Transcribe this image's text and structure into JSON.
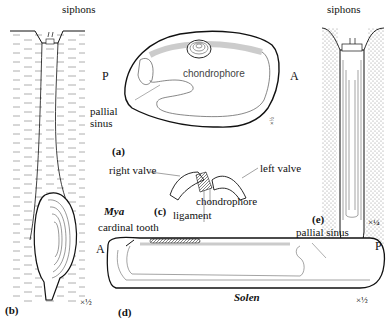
{
  "figure": {
    "panels": {
      "a": {
        "id": "(a)",
        "labels": {
          "posterior": "P",
          "anterior": "A",
          "chondrophore": "chondrophore",
          "pallial_sinus": "pallial\nsinus",
          "pallial": "pallial",
          "sinus": "sinus"
        },
        "scale": "×½"
      },
      "b": {
        "id": "(b)",
        "labels": {
          "siphons": "siphons"
        },
        "scale": "×½"
      },
      "c": {
        "id": "(c)",
        "labels": {
          "right_valve": "right valve",
          "left_valve": "left valve",
          "chondrophore": "chondrophore",
          "ligament": "ligament"
        }
      },
      "d": {
        "id": "(d)",
        "genus_mya": "Mya",
        "genus_solen": "Solen",
        "labels": {
          "cardinal_tooth": "cardinal tooth",
          "anterior": "A",
          "posterior": "P",
          "pallial_sinus": "pallial sinus"
        },
        "scale": "×½"
      },
      "e": {
        "id": "(e)",
        "labels": {
          "siphons": "siphons"
        },
        "scale": "×¼"
      }
    },
    "colors": {
      "ink": "#111111",
      "label_gray": "#444444",
      "stipple": "#888888"
    }
  }
}
